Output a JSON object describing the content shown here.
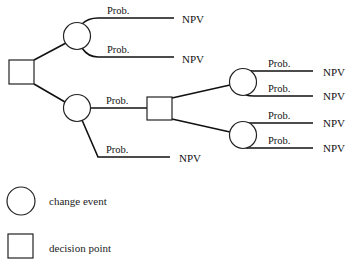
{
  "diagram": {
    "type": "decision-tree",
    "nodes": {
      "root_decision": {
        "shape": "square",
        "label": "decision point"
      },
      "event_top": {
        "shape": "circle",
        "label": "change event"
      },
      "event_bottom": {
        "shape": "circle",
        "label": "change event"
      },
      "decision_mid": {
        "shape": "square",
        "label": "decision point"
      },
      "event_right_top": {
        "shape": "circle",
        "label": "change event"
      },
      "event_right_bottom": {
        "shape": "circle",
        "label": "change event"
      }
    },
    "branches": {
      "top_1": {
        "prob": "Prob.",
        "outcome": "NPV"
      },
      "top_2": {
        "prob": "Prob.",
        "outcome": "NPV"
      },
      "bottom_to_decision": {
        "prob": "Prob."
      },
      "bottom_2": {
        "prob": "Prob.",
        "outcome": "NPV"
      },
      "rt_1": {
        "prob": "Prob.",
        "outcome": "NPV"
      },
      "rt_2": {
        "prob": "Prob.",
        "outcome": "NPV"
      },
      "rb_1": {
        "prob": "Prob.",
        "outcome": "NPV"
      },
      "rb_2": {
        "prob": "Prob.",
        "outcome": "NPV"
      }
    }
  },
  "legend": {
    "circle_label": "change event",
    "square_label": "decision point"
  }
}
